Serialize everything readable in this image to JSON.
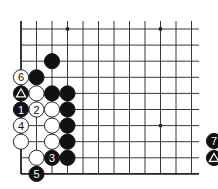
{
  "diagram": {
    "type": "go-board-fragment",
    "grid": {
      "origin_x": 21,
      "origin_y": 29,
      "dx": 15.5,
      "dy": 16.1,
      "cols": 12,
      "rows": 10,
      "left_edge": true,
      "bottom_edge": true,
      "line_right_x": 199,
      "line_top_y": 21
    },
    "colors": {
      "line": "#222222",
      "black": "#111111",
      "white": "#ffffff",
      "bg": "#ffffff"
    },
    "star_points": [
      [
        3,
        0
      ],
      [
        9,
        0
      ],
      [
        9,
        6
      ]
    ],
    "stones": [
      {
        "c": 2,
        "r": 2,
        "color": "black",
        "label": ""
      },
      {
        "c": 0,
        "r": 3,
        "color": "white",
        "label": "6"
      },
      {
        "c": 1,
        "r": 3,
        "color": "black",
        "label": ""
      },
      {
        "c": 0,
        "r": 4,
        "color": "black",
        "label": "△"
      },
      {
        "c": 1,
        "r": 4,
        "color": "white",
        "label": ""
      },
      {
        "c": 2,
        "r": 4,
        "color": "black",
        "label": ""
      },
      {
        "c": 3,
        "r": 4,
        "color": "black",
        "label": ""
      },
      {
        "c": 0,
        "r": 5,
        "color": "black",
        "label": "1"
      },
      {
        "c": 1,
        "r": 5,
        "color": "white",
        "label": "2"
      },
      {
        "c": 2,
        "r": 5,
        "color": "white",
        "label": ""
      },
      {
        "c": 3,
        "r": 5,
        "color": "black",
        "label": ""
      },
      {
        "c": 0,
        "r": 6,
        "color": "white",
        "label": "4"
      },
      {
        "c": 2,
        "r": 6,
        "color": "white",
        "label": ""
      },
      {
        "c": 3,
        "r": 6,
        "color": "black",
        "label": ""
      },
      {
        "c": 0,
        "r": 7,
        "color": "white",
        "label": ""
      },
      {
        "c": 2,
        "r": 7,
        "color": "white",
        "label": ""
      },
      {
        "c": 3,
        "r": 7,
        "color": "black",
        "label": ""
      },
      {
        "c": 1,
        "r": 8,
        "color": "white",
        "label": ""
      },
      {
        "c": 2,
        "r": 8,
        "color": "black",
        "label": "3"
      },
      {
        "c": 3,
        "r": 8,
        "color": "black",
        "label": ""
      },
      {
        "c": 1,
        "r": 9,
        "color": "black",
        "label": "5"
      }
    ],
    "legend_partial": [
      {
        "x": 214,
        "y": 141,
        "color": "black",
        "label": "7"
      },
      {
        "x": 214,
        "y": 158,
        "color": "black",
        "label": "△"
      }
    ]
  }
}
